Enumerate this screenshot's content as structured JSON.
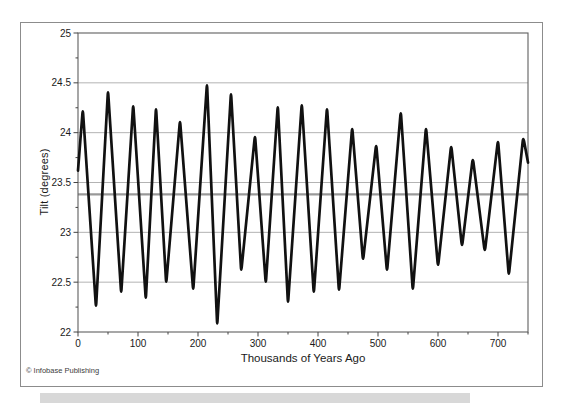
{
  "figure": {
    "copyright": "© Infobase Publishing"
  },
  "chart_data": {
    "type": "line",
    "title": "",
    "xlabel": "Thousands of Years Ago",
    "ylabel": "Tilt (degrees)",
    "xlim": [
      0,
      750
    ],
    "ylim": [
      22,
      25
    ],
    "x_ticks": [
      0,
      100,
      200,
      300,
      400,
      500,
      600,
      700
    ],
    "x_minor_tick_step": 50,
    "y_ticks": [
      22,
      22.5,
      23,
      23.5,
      24,
      24.5,
      25
    ],
    "y_minor_tick_step": 0.25,
    "grid": "horizontal-major",
    "legend": "none",
    "reference_line": {
      "value": 23.38,
      "color": "#999999"
    },
    "series": [
      {
        "name": "axial-tilt",
        "color": "#111111",
        "points": [
          [
            0,
            23.62
          ],
          [
            8,
            24.24
          ],
          [
            30,
            22.24
          ],
          [
            50,
            24.43
          ],
          [
            72,
            22.38
          ],
          [
            92,
            24.29
          ],
          [
            113,
            22.32
          ],
          [
            130,
            24.26
          ],
          [
            147,
            22.48
          ],
          [
            170,
            24.13
          ],
          [
            192,
            22.41
          ],
          [
            215,
            24.5
          ],
          [
            232,
            22.06
          ],
          [
            255,
            24.41
          ],
          [
            272,
            22.6
          ],
          [
            295,
            23.98
          ],
          [
            313,
            22.48
          ],
          [
            333,
            24.28
          ],
          [
            350,
            22.28
          ],
          [
            373,
            24.3
          ],
          [
            393,
            22.38
          ],
          [
            415,
            24.26
          ],
          [
            435,
            22.4
          ],
          [
            457,
            24.06
          ],
          [
            475,
            22.71
          ],
          [
            497,
            23.89
          ],
          [
            515,
            22.6
          ],
          [
            538,
            24.22
          ],
          [
            558,
            22.41
          ],
          [
            580,
            24.06
          ],
          [
            600,
            22.65
          ],
          [
            622,
            23.88
          ],
          [
            640,
            22.85
          ],
          [
            658,
            23.75
          ],
          [
            678,
            22.8
          ],
          [
            700,
            23.93
          ],
          [
            718,
            22.56
          ],
          [
            742,
            23.96
          ],
          [
            750,
            23.7
          ]
        ]
      }
    ]
  }
}
